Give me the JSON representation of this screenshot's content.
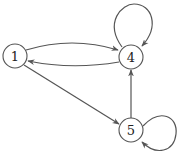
{
  "diagram": {
    "type": "directed-graph",
    "colors": {
      "stroke": "#555555",
      "node_fill": "#ffffff",
      "text": "#222222",
      "background": "#ffffff"
    },
    "nodes": [
      {
        "id": "1",
        "label": "1",
        "x": 15,
        "y": 56
      },
      {
        "id": "4",
        "label": "4",
        "x": 131,
        "y": 56
      },
      {
        "id": "5",
        "label": "5",
        "x": 131,
        "y": 130
      }
    ],
    "edges": [
      {
        "from": "1",
        "to": "4",
        "style": "curved-upper"
      },
      {
        "from": "4",
        "to": "1",
        "style": "curved-lower"
      },
      {
        "from": "1",
        "to": "5",
        "style": "straight"
      },
      {
        "from": "5",
        "to": "4",
        "style": "straight"
      },
      {
        "from": "4",
        "to": "4",
        "style": "self-loop-top"
      },
      {
        "from": "5",
        "to": "5",
        "style": "self-loop-right"
      }
    ]
  }
}
